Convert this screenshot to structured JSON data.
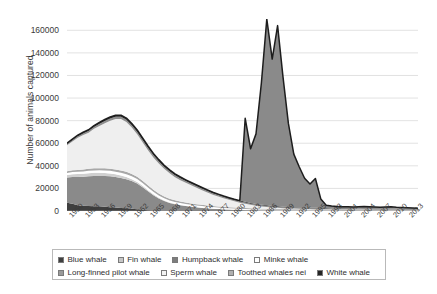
{
  "chart_data": {
    "type": "area",
    "stacked": true,
    "title": "",
    "xlabel": "",
    "ylabel": "Number of animals captured",
    "ylim": [
      0,
      170000
    ],
    "yticks": [
      0,
      20000,
      40000,
      60000,
      80000,
      100000,
      120000,
      140000,
      160000
    ],
    "ytick_labels": [
      "0",
      "20000",
      "40000",
      "60000",
      "80000",
      "100000",
      "120000",
      "140000",
      "160000"
    ],
    "grid": true,
    "legend_position": "bottom",
    "xlim": [
      1950,
      2015
    ],
    "x": [
      1950,
      1951,
      1952,
      1953,
      1954,
      1955,
      1956,
      1957,
      1958,
      1959,
      1960,
      1961,
      1962,
      1963,
      1964,
      1965,
      1966,
      1967,
      1968,
      1969,
      1970,
      1971,
      1972,
      1973,
      1974,
      1975,
      1976,
      1977,
      1978,
      1979,
      1980,
      1981,
      1982,
      1983,
      1984,
      1985,
      1986,
      1987,
      1988,
      1989,
      1990,
      1991,
      1992,
      1993,
      1994,
      1995,
      1996,
      1997,
      1998,
      1999,
      2000,
      2001,
      2002,
      2003,
      2004,
      2005,
      2006,
      2007,
      2008,
      2009,
      2010,
      2011,
      2012,
      2013,
      2014,
      2015
    ],
    "xtick_labels": [
      "1950",
      "1953",
      "1956",
      "1959",
      "1962",
      "1965",
      "1968",
      "1971",
      "1974",
      "1977",
      "1980",
      "1983",
      "1986",
      "1989",
      "1992",
      "1995",
      "1998",
      "2001",
      "2004",
      "2007",
      "2010",
      "2013"
    ],
    "xtick_years": [
      1950,
      1953,
      1956,
      1959,
      1962,
      1965,
      1968,
      1971,
      1974,
      1977,
      1980,
      1983,
      1986,
      1989,
      1992,
      1995,
      1998,
      2001,
      2004,
      2007,
      2010,
      2013
    ],
    "series": [
      {
        "name": "Blue whale",
        "color": "#3f3f3f",
        "values": [
          7200,
          6400,
          5200,
          4600,
          4400,
          4300,
          4100,
          3800,
          3400,
          3100,
          2700,
          2400,
          1900,
          1500,
          1050,
          700,
          480,
          330,
          230,
          170,
          130,
          105,
          85,
          70,
          58,
          48,
          40,
          34,
          28,
          24,
          20,
          17,
          14,
          12,
          10,
          9,
          8,
          7,
          6,
          5,
          5,
          4,
          4,
          3,
          3,
          3,
          2,
          2,
          2,
          2,
          2,
          2,
          2,
          2,
          2,
          2,
          2,
          2,
          2,
          2,
          2,
          2,
          2,
          2,
          2,
          2
        ]
      },
      {
        "name": "Fin whale",
        "color": "#8a8a8a",
        "values": [
          22500,
          23800,
          25000,
          25800,
          26400,
          26800,
          27000,
          27200,
          27300,
          27000,
          26500,
          25800,
          24600,
          22800,
          20000,
          16800,
          13500,
          10800,
          8600,
          7000,
          5900,
          5000,
          4300,
          3700,
          3200,
          2700,
          2300,
          1950,
          1650,
          1400,
          1200,
          1000,
          850,
          720,
          610,
          520,
          440,
          380,
          330,
          290,
          260,
          230,
          210,
          190,
          175,
          160,
          150,
          140,
          130,
          125,
          120,
          115,
          112,
          110,
          108,
          106,
          105,
          104,
          103,
          102,
          101,
          100,
          100,
          100,
          100,
          100
        ]
      },
      {
        "name": "Humpback whale",
        "color": "#d0d0d0",
        "values": [
          2200,
          2400,
          2500,
          2600,
          2650,
          2700,
          2700,
          2650,
          2550,
          2400,
          2200,
          1950,
          1700,
          1450,
          1200,
          980,
          800,
          650,
          520,
          420,
          340,
          280,
          230,
          190,
          160,
          135,
          115,
          98,
          84,
          72,
          62,
          54,
          47,
          41,
          36,
          32,
          28,
          25,
          22,
          20,
          18,
          16,
          15,
          14,
          13,
          12,
          11,
          10,
          10,
          9,
          9,
          8,
          8,
          8,
          7,
          7,
          7,
          7,
          6,
          6,
          6,
          6,
          6,
          6,
          6,
          6
        ]
      },
      {
        "name": "Minke whale",
        "color": "#ffffff",
        "values": [
          1800,
          1900,
          2000,
          2050,
          2100,
          2150,
          2200,
          2250,
          2300,
          2350,
          2400,
          2450,
          2500,
          2500,
          2450,
          2350,
          2200,
          2050,
          1900,
          1800,
          1700,
          1650,
          1600,
          1550,
          1500,
          1450,
          1400,
          1350,
          1300,
          1250,
          1200,
          1150,
          1100,
          1050,
          1000,
          960,
          920,
          880,
          850,
          820,
          800,
          780,
          760,
          740,
          720,
          700,
          690,
          680,
          670,
          660,
          650,
          640,
          630,
          620,
          610,
          600,
          590,
          580,
          570,
          560,
          550,
          545,
          540,
          535,
          530,
          525
        ]
      },
      {
        "name": "Long-finned pilot whale",
        "color": "#a8a8a8",
        "values": [
          1500,
          1600,
          1700,
          1750,
          1800,
          1800,
          1850,
          1900,
          1950,
          2000,
          2050,
          2100,
          2150,
          2150,
          2100,
          2000,
          1900,
          1750,
          1600,
          1500,
          1400,
          1300,
          1250,
          1200,
          1150,
          1100,
          1050,
          1000,
          960,
          920,
          880,
          840,
          800,
          770,
          740,
          710,
          680,
          650,
          630,
          610,
          590,
          570,
          550,
          535,
          520,
          505,
          495,
          485,
          475,
          465,
          455,
          445,
          440,
          435,
          430,
          425,
          420,
          415,
          410,
          405,
          400,
          395,
          390,
          385,
          380,
          375
        ]
      },
      {
        "name": "Sperm whale",
        "color": "#efefef",
        "values": [
          23000,
          25500,
          28500,
          30500,
          32000,
          35000,
          37500,
          40000,
          42500,
          44500,
          45500,
          44000,
          41000,
          37500,
          34000,
          31000,
          28500,
          26500,
          24500,
          22500,
          20500,
          19000,
          17500,
          16000,
          14500,
          13000,
          11500,
          10000,
          8800,
          7600,
          6500,
          5500,
          4600,
          3800,
          3100,
          2500,
          2000,
          1600,
          1300,
          1050,
          850,
          700,
          580,
          480,
          400,
          340,
          290,
          250,
          215,
          190,
          170,
          155,
          142,
          132,
          124,
          118,
          112,
          108,
          104,
          100,
          97,
          94,
          92,
          90,
          88,
          86
        ]
      },
      {
        "name": "Toothed whales nei",
        "color": "#8f8f8f",
        "values": [
          1200,
          1300,
          1400,
          1500,
          1600,
          1700,
          1800,
          1900,
          1950,
          2000,
          2050,
          2100,
          2150,
          2200,
          2200,
          2150,
          2100,
          2000,
          1900,
          1800,
          1700,
          1650,
          1600,
          1550,
          1500,
          1450,
          1400,
          1350,
          1300,
          1250,
          1200,
          1150,
          1100,
          1050,
          1000,
          960,
          920,
          880,
          850,
          820,
          800,
          780,
          760,
          740,
          720,
          700,
          690,
          680,
          670,
          660,
          650,
          640,
          630,
          620,
          610,
          600,
          590,
          580,
          570,
          560,
          550,
          545,
          540,
          535,
          530,
          525
        ]
      },
      {
        "name": "White whale",
        "color": "#2b2b2b",
        "values": [
          600,
          700,
          800,
          900,
          1000,
          1100,
          1200,
          1300,
          1350,
          1400,
          1450,
          1500,
          1550,
          1600,
          1600,
          1550,
          1500,
          1400,
          1300,
          1200,
          1150,
          1100,
          1050,
          1000,
          960,
          920,
          880,
          840,
          800,
          770,
          740,
          710,
          680,
          650,
          620,
          600,
          580,
          560,
          540,
          520,
          500,
          490,
          480,
          470,
          460,
          450,
          445,
          440,
          435,
          430,
          425,
          420,
          415,
          410,
          405,
          400,
          395,
          390,
          385,
          380,
          375,
          370,
          368,
          365,
          362,
          360
        ]
      },
      {
        "name": "Unspecified surge",
        "color": "#8a8a8a",
        "hidden_from_legend": true,
        "values": [
          0,
          0,
          0,
          0,
          0,
          0,
          0,
          0,
          0,
          0,
          0,
          0,
          0,
          0,
          0,
          0,
          0,
          0,
          0,
          0,
          0,
          0,
          0,
          0,
          0,
          0,
          0,
          0,
          0,
          0,
          0,
          0,
          0,
          74000,
          48000,
          62000,
          108000,
          165000,
          130000,
          160000,
          115000,
          74000,
          47000,
          36000,
          26000,
          21000,
          26000,
          8000,
          2500,
          1800,
          1500,
          1400,
          1300,
          1200,
          1500,
          1800,
          1600,
          1400,
          1200,
          1500,
          1700,
          1300,
          1100,
          900,
          700,
          500
        ]
      }
    ]
  },
  "legend": {
    "row1": [
      {
        "label": "Blue whale",
        "color": "#3f3f3f"
      },
      {
        "label": "Fin whale",
        "color": "#c6c6c6"
      },
      {
        "label": "Humpback whale",
        "color": "#7d7d7d"
      },
      {
        "label": "Minke whale",
        "color": "#ffffff"
      }
    ],
    "row2": [
      {
        "label": "Long-finned pilot whale",
        "color": "#9a9a9a"
      },
      {
        "label": "Sperm whale",
        "color": "#f2f2f2"
      },
      {
        "label": "Toothed whales nei",
        "color": "#b0b0b0"
      },
      {
        "label": "White whale",
        "color": "#242424"
      }
    ]
  },
  "axes": {
    "y_title": "Number of animals captured"
  },
  "watermark": ""
}
